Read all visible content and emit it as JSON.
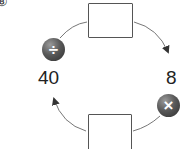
{
  "question": {
    "number": "⑧"
  },
  "diagram": {
    "start_value": "40",
    "middle_value": "8",
    "operations": [
      {
        "symbol": "÷",
        "name": "divide"
      },
      {
        "symbol": "×",
        "name": "multiply"
      }
    ],
    "boxes": [
      {
        "position": "top",
        "value": ""
      },
      {
        "position": "bottom",
        "value": ""
      }
    ],
    "colors": {
      "operator_circle": "#4a4a4a",
      "arrow": "#555555",
      "box_border": "#555555"
    }
  }
}
